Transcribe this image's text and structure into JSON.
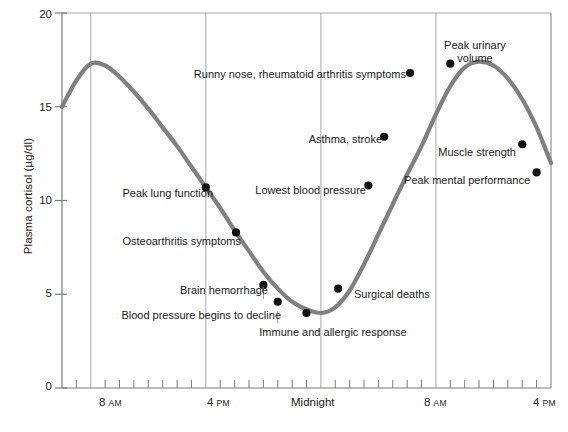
{
  "chart_data": {
    "type": "line",
    "title": "",
    "xlabel": "",
    "ylabel": "Plasma cortisol (µg/dl)",
    "ylim": [
      0,
      20
    ],
    "yticks": [
      0,
      5,
      10,
      15,
      20
    ],
    "ytick_labels": [
      "0",
      "5",
      "10",
      "15",
      "20"
    ],
    "xlim_hours": [
      6,
      40
    ],
    "x_minor_tick_interval_hours": 1,
    "grid": "vertical gridlines at labeled times only",
    "legend": "none",
    "line_color": "#808080",
    "point_color": "#000000",
    "axis_color": "#999999",
    "xtick_labels": [
      {
        "time": "8",
        "meridiem": "AM",
        "hour": 8
      },
      {
        "time": "4",
        "meridiem": "PM",
        "hour": 16
      },
      {
        "time": "Midnight",
        "meridiem": "",
        "hour": 24
      },
      {
        "time": "8",
        "meridiem": "AM",
        "hour": 32
      },
      {
        "time": "4",
        "meridiem": "PM",
        "hour": 40
      }
    ],
    "x": [
      6,
      7,
      8,
      9,
      10,
      11,
      12,
      13,
      14,
      15,
      16,
      17,
      18,
      19,
      20,
      21,
      22,
      23,
      24,
      25,
      26,
      27,
      28,
      29,
      30,
      31,
      32,
      33,
      34,
      35,
      36,
      37,
      38,
      39,
      40
    ],
    "values": [
      15.0,
      16.4,
      17.3,
      17.2,
      16.6,
      15.8,
      14.9,
      13.9,
      12.9,
      11.8,
      10.7,
      9.6,
      8.4,
      7.3,
      6.2,
      5.3,
      4.6,
      4.2,
      4.0,
      4.3,
      5.2,
      6.6,
      8.2,
      9.8,
      11.4,
      12.9,
      14.6,
      16.1,
      17.1,
      17.4,
      17.2,
      16.5,
      15.4,
      13.9,
      12.0
    ],
    "annotations": [
      {
        "label": "Peak lung function",
        "hour": 16.0,
        "value": 10.7,
        "align": "right"
      },
      {
        "label": "Osteoarthritis symptoms",
        "hour": 18.1,
        "value": 8.3,
        "align": "right"
      },
      {
        "label": "Brain hemorrhage",
        "hour": 20.0,
        "value": 5.5,
        "align": "right"
      },
      {
        "label": "Blood pressure begins to decline",
        "hour": 21.0,
        "value": 4.6,
        "align": "right"
      },
      {
        "label": "Immune and allergic response",
        "hour": 23.0,
        "value": 4.0,
        "align": "center"
      },
      {
        "label": "Surgical deaths",
        "hour": 25.2,
        "value": 5.3,
        "align": "left"
      },
      {
        "label": "Lowest blood pressure",
        "hour": 27.3,
        "value": 10.8,
        "align": "right"
      },
      {
        "label": "Asthma, stroke",
        "hour": 28.4,
        "value": 13.4,
        "align": "right"
      },
      {
        "label": "Runny nose, rheumatoid arthritis symptoms",
        "hour": 30.2,
        "value": 16.8,
        "align": "right"
      },
      {
        "label": "Peak urinary volume",
        "hour": 33.0,
        "value": 17.3,
        "align": "center"
      },
      {
        "label": "Muscle strength",
        "hour": 38.0,
        "value": 13.0,
        "align": "right"
      },
      {
        "label": "Peak mental performance",
        "hour": 39.0,
        "value": 11.5,
        "align": "right"
      }
    ]
  },
  "axis": {
    "y_label": "Plasma cortisol (µg/dl)",
    "y_tick_0": "0",
    "y_tick_5": "5",
    "y_tick_10": "10",
    "y_tick_15": "15",
    "y_tick_20": "20",
    "x_tick_1_time": "8",
    "x_tick_1_meridiem": "AM",
    "x_tick_2_time": "4",
    "x_tick_2_meridiem": "PM",
    "x_tick_3_time": "Midnight",
    "x_tick_4_time": "8",
    "x_tick_4_meridiem": "AM",
    "x_tick_5_time": "4",
    "x_tick_5_meridiem": "PM"
  },
  "annotations": {
    "peak_lung_function": "Peak lung function",
    "osteoarthritis_symptoms": "Osteoarthritis symptoms",
    "brain_hemorrhage": "Brain hemorrhage",
    "blood_pressure_decline": "Blood pressure begins to decline",
    "immune_allergic_response": "Immune and allergic response",
    "surgical_deaths": "Surgical deaths",
    "lowest_blood_pressure": "Lowest blood pressure",
    "asthma_stroke": "Asthma, stroke",
    "runny_nose": "Runny nose, rheumatoid arthritis symptoms",
    "peak_urinary_volume_l1": "Peak urinary",
    "peak_urinary_volume_l2": "volume",
    "muscle_strength": "Muscle strength",
    "peak_mental_performance": "Peak mental performance"
  }
}
